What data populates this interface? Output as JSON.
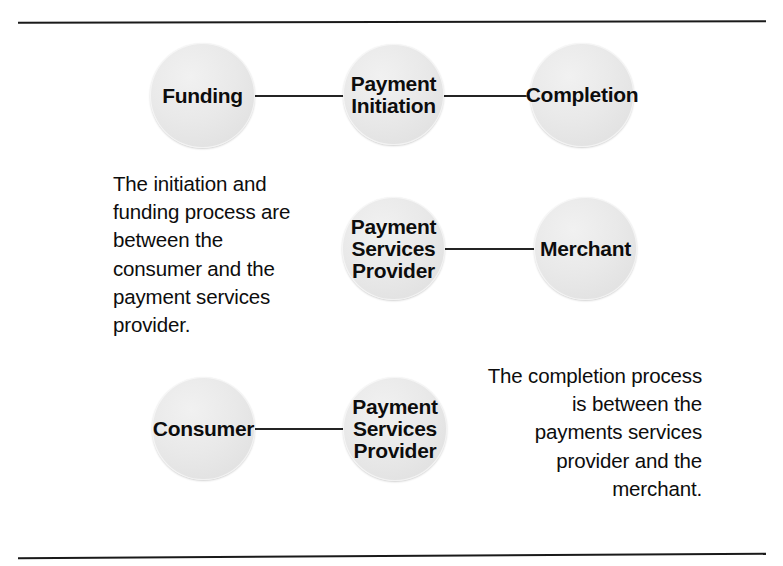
{
  "figure": {
    "type": "process-relationship-diagram",
    "background_color": "#ffffff",
    "rule_color": "#1a1a1a",
    "node_fill_color": "#e8e8e8",
    "node_text_color": "#0d0d0d",
    "connector_color": "#242424"
  },
  "rows": [
    {
      "id": "row-stages",
      "nodes": [
        {
          "id": "funding",
          "lines": [
            "Funding"
          ]
        },
        {
          "id": "payment-initiation",
          "lines": [
            "Payment",
            "Initiation"
          ]
        },
        {
          "id": "completion",
          "lines": [
            "Completion"
          ]
        }
      ],
      "connections": [
        {
          "from": "funding",
          "to": "payment-initiation"
        },
        {
          "from": "payment-initiation",
          "to": "completion"
        }
      ]
    },
    {
      "id": "row-psp-merchant",
      "nodes": [
        {
          "id": "psp-middle",
          "lines": [
            "Payment",
            "Services",
            "Provider"
          ]
        },
        {
          "id": "merchant",
          "lines": [
            "Merchant"
          ]
        }
      ],
      "connections": [
        {
          "from": "psp-middle",
          "to": "merchant"
        }
      ]
    },
    {
      "id": "row-consumer-psp",
      "nodes": [
        {
          "id": "consumer",
          "lines": [
            "Consumer"
          ]
        },
        {
          "id": "psp-bottom",
          "lines": [
            "Payment",
            "Services",
            "Provider"
          ]
        }
      ],
      "connections": [
        {
          "from": "consumer",
          "to": "psp-bottom"
        }
      ]
    }
  ],
  "annotations": {
    "left": {
      "id": "initiation-funding-note",
      "align": "left",
      "text": "The initiation and funding process are between the consumer and the payment services provider.",
      "lines": [
        "The initiation and",
        "funding process are",
        "between the",
        "consumer and the",
        "payment services",
        "provider."
      ]
    },
    "right": {
      "id": "completion-note",
      "align": "right",
      "text": "The completion process is between the payments services provider and the merchant.",
      "lines": [
        "The completion process",
        "is between the",
        "payments services",
        "provider and the",
        "merchant."
      ]
    }
  }
}
